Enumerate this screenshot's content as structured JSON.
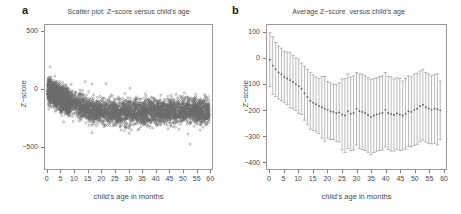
{
  "figure": {
    "panels": [
      {
        "letter": "a"
      },
      {
        "letter": "b"
      }
    ]
  },
  "chart_data": [
    {
      "panel": "a",
      "type": "scatter",
      "title": "Scatter plot: Z−score versus child's age",
      "xlabel": "child's age in months",
      "ylabel": "Z−score",
      "xlim": [
        -1,
        61
      ],
      "ylim": [
        -700,
        560
      ],
      "xticks": [
        0,
        5,
        10,
        15,
        20,
        25,
        30,
        35,
        40,
        45,
        50,
        55,
        60
      ],
      "xtick_labels": [
        "0",
        "5",
        "10",
        "15",
        "20",
        "25",
        "30",
        "35",
        "40",
        "45",
        "50",
        "55",
        "60"
      ],
      "yticks": [
        500,
        0,
        -500
      ],
      "ytick_labels": [
        "500",
        "0",
        "−500"
      ],
      "grid": false,
      "legend": "none",
      "marker": "open-circle",
      "marker_color": "#6b6b6b",
      "n_points": 5200,
      "description": "Dense cloud of open circles; central mass drifts from about 0 at age 0 down to about −200 by age 20 and stays near −200 through age 60. Spread roughly ±250 with scattered outliers up to +500 and down to −650.",
      "trend_by_month": {
        "months": [
          0,
          5,
          10,
          15,
          20,
          25,
          30,
          35,
          40,
          45,
          50,
          55,
          60
        ],
        "center": [
          -10,
          -80,
          -130,
          -180,
          -200,
          -205,
          -200,
          -205,
          -200,
          -195,
          -185,
          -190,
          -200
        ],
        "spread": [
          170,
          180,
          185,
          190,
          190,
          195,
          195,
          195,
          195,
          195,
          190,
          190,
          190
        ]
      }
    },
    {
      "panel": "b",
      "type": "line",
      "title": "Average Z−score  versus child's age",
      "xlabel": "child's age in months",
      "ylabel": "Z−score",
      "xlim": [
        -1,
        61
      ],
      "ylim": [
        -430,
        130
      ],
      "xticks": [
        0,
        5,
        10,
        15,
        20,
        25,
        30,
        35,
        40,
        45,
        50,
        55,
        60
      ],
      "xtick_labels": [
        "0",
        "5",
        "10",
        "15",
        "20",
        "25",
        "30",
        "35",
        "40",
        "45",
        "50",
        "55",
        "60"
      ],
      "yticks": [
        100,
        0,
        -100,
        -200,
        -300,
        -400
      ],
      "ytick_labels": [
        "100",
        "0",
        "−100",
        "−200",
        "−300",
        "−400"
      ],
      "grid": false,
      "legend": "none",
      "marker": "filled-circle",
      "marker_color": "#6b6b6b",
      "errorbar_color": "#8a8a8a",
      "errorbar_style": "vertical with caps",
      "x": [
        0,
        1,
        2,
        3,
        4,
        5,
        6,
        7,
        8,
        9,
        10,
        11,
        12,
        13,
        14,
        15,
        16,
        17,
        18,
        19,
        20,
        21,
        22,
        23,
        24,
        25,
        26,
        27,
        28,
        29,
        30,
        31,
        32,
        33,
        34,
        35,
        36,
        37,
        38,
        39,
        40,
        41,
        42,
        43,
        44,
        45,
        46,
        47,
        48,
        49,
        50,
        51,
        52,
        53,
        54,
        55,
        56,
        57,
        58,
        59
      ],
      "mean": [
        -5,
        -28,
        -42,
        -55,
        -62,
        -72,
        -78,
        -85,
        -92,
        -100,
        -108,
        -118,
        -135,
        -150,
        -165,
        -172,
        -178,
        -185,
        -190,
        -196,
        -200,
        -205,
        -208,
        -212,
        -210,
        -218,
        -222,
        -205,
        -215,
        -212,
        -196,
        -205,
        -208,
        -212,
        -220,
        -228,
        -222,
        -218,
        -214,
        -212,
        -200,
        -212,
        -216,
        -220,
        -214,
        -218,
        -222,
        -215,
        -205,
        -208,
        -200,
        -196,
        -186,
        -180,
        -190,
        -195,
        -200,
        -196,
        -198,
        -202
      ],
      "error_upper": [
        100,
        85,
        62,
        48,
        40,
        28,
        25,
        22,
        12,
        2,
        -2,
        -18,
        -30,
        -42,
        -55,
        -65,
        -72,
        -78,
        -70,
        -70,
        -90,
        -95,
        -100,
        -102,
        -95,
        -80,
        -78,
        -60,
        -72,
        -68,
        -55,
        -60,
        -62,
        -68,
        -75,
        -82,
        -78,
        -75,
        -70,
        -68,
        -55,
        -70,
        -72,
        -80,
        -75,
        -78,
        -88,
        -78,
        -68,
        -72,
        -62,
        -58,
        -48,
        -42,
        -55,
        -60,
        -68,
        -62,
        -60,
        -88
      ],
      "error_lower": [
        -110,
        -140,
        -148,
        -158,
        -165,
        -172,
        -180,
        -192,
        -196,
        -202,
        -215,
        -218,
        -240,
        -258,
        -275,
        -280,
        -285,
        -292,
        -310,
        -322,
        -310,
        -315,
        -316,
        -322,
        -325,
        -356,
        -366,
        -350,
        -358,
        -356,
        -337,
        -350,
        -354,
        -358,
        -365,
        -374,
        -366,
        -361,
        -358,
        -356,
        -345,
        -354,
        -360,
        -360,
        -353,
        -358,
        -356,
        -352,
        -342,
        -344,
        -338,
        -334,
        -324,
        -318,
        -325,
        -330,
        -332,
        -330,
        -336,
        -316
      ]
    }
  ]
}
